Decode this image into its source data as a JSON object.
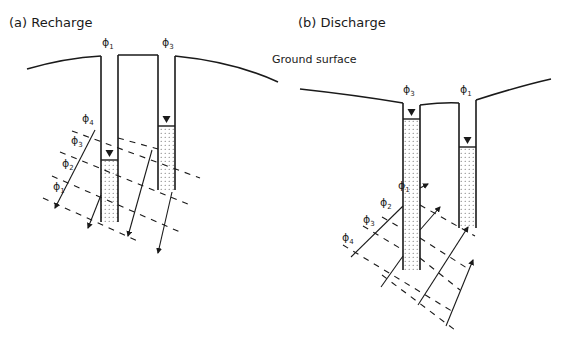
{
  "panels": [
    {
      "id": "recharge",
      "title": "(a) Recharge",
      "well_labels": [
        "ϕ",
        "ϕ"
      ],
      "well_subscripts": [
        "1",
        "3"
      ],
      "equipotential_labels": [
        "ϕ",
        "ϕ",
        "ϕ",
        "ϕ"
      ],
      "equipotential_subscripts": [
        "4",
        "3",
        "2",
        "1"
      ],
      "flow_direction": "downward"
    },
    {
      "id": "discharge",
      "title": "(b) Discharge",
      "well_labels": [
        "ϕ",
        "ϕ"
      ],
      "well_subscripts": [
        "3",
        "1"
      ],
      "equipotential_labels": [
        "ϕ",
        "ϕ",
        "ϕ",
        "ϕ"
      ],
      "equipotential_subscripts": [
        "1",
        "2",
        "3",
        "4"
      ],
      "flow_direction": "upward"
    }
  ],
  "annotations": {
    "ground_surface": "Ground surface"
  },
  "colors": {
    "line": "#1a1a1a",
    "water_fill": "#ffffff",
    "water_dots": "#555555"
  }
}
